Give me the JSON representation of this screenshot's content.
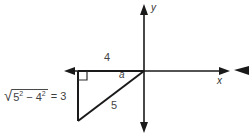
{
  "figure": {
    "background_color": "#ffffff",
    "line_color": "#1a1a1a",
    "text_color": "#3f3f3f",
    "axes": {
      "y_label": "y",
      "x_label": "x",
      "origin": {
        "x": 144,
        "y": 71
      }
    },
    "triangle": {
      "vertices": {
        "origin": {
          "x": 144,
          "y": 71
        },
        "top_left": {
          "x": 78,
          "y": 71
        },
        "bottom_left": {
          "x": 78,
          "y": 121
        }
      },
      "right_angle_at": "top-left",
      "labels": {
        "top_side": "4",
        "hypotenuse": "5",
        "angle": "a"
      }
    },
    "expression": {
      "radical_sign": "√",
      "radicand_base1": "5",
      "radicand_exp1": "2",
      "operator": "−",
      "radicand_base2": "4",
      "radicand_exp2": "2",
      "equals": "= 3"
    }
  }
}
